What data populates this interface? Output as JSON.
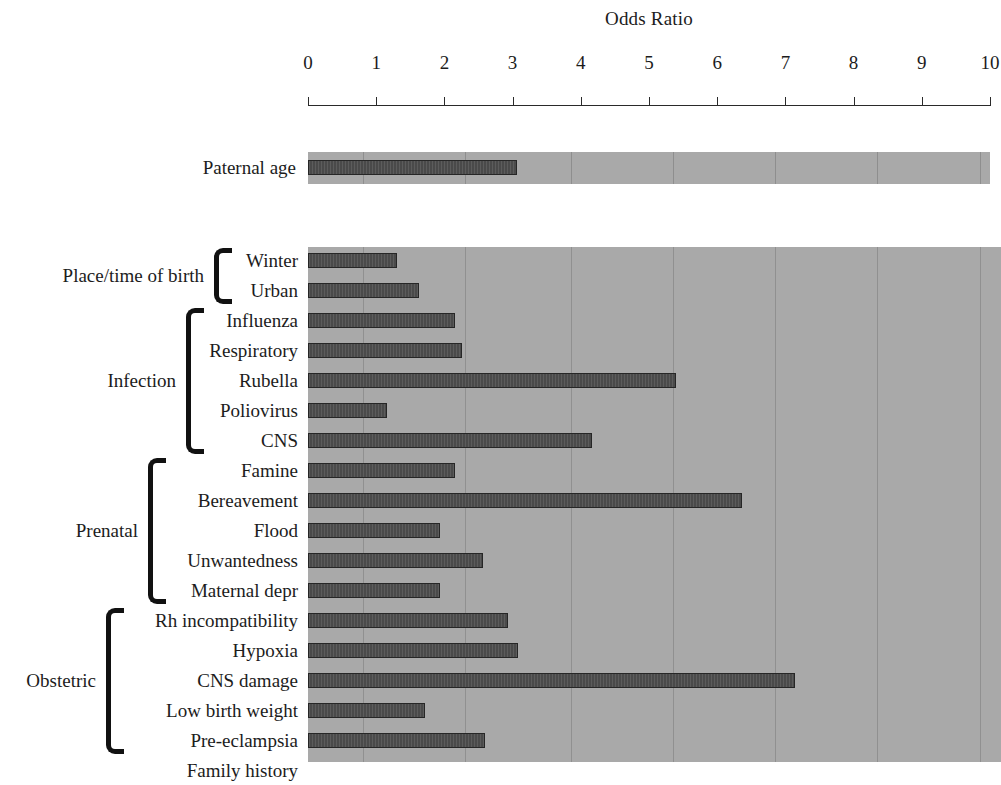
{
  "chart_data": {
    "type": "bar",
    "orientation": "horizontal",
    "title": "Odds Ratio",
    "xlabel": "",
    "ylabel": "",
    "xlim": [
      0,
      10
    ],
    "xticks": [
      0,
      1,
      2,
      3,
      4,
      5,
      6,
      7,
      8,
      9,
      10
    ],
    "xtick_labels": [
      "0",
      "1",
      "2",
      "3",
      "4",
      "5",
      "6",
      "7",
      "8",
      "9",
      "10"
    ],
    "grid": true,
    "grid_axis": "x",
    "legend": "none",
    "panels": [
      {
        "name": "paternal-age-panel",
        "categories": [
          "Paternal age"
        ],
        "values": [
          3.06
        ]
      },
      {
        "name": "risk-factors-panel",
        "categories": [
          "Winter",
          "Urban",
          "Influenza",
          "Respiratory",
          "Rubella",
          "Poliovirus",
          "CNS",
          "Famine",
          "Bereavement",
          "Flood",
          "Unwantedness",
          "Maternal depr",
          "Rh incompatibility",
          "Hypoxia",
          "CNS damage",
          "Low birth weight",
          "Pre-eclampsia",
          "Family history"
        ],
        "values": [
          1.3,
          1.63,
          2.16,
          2.26,
          5.4,
          1.16,
          4.16,
          2.16,
          6.36,
          1.94,
          2.57,
          1.94,
          2.93,
          3.08,
          7.14,
          1.72,
          2.6,
          9.85
        ]
      }
    ],
    "groups": [
      {
        "label": "Place/time of birth",
        "members": [
          "Winter",
          "Urban"
        ]
      },
      {
        "label": "Infection",
        "members": [
          "Influenza",
          "Respiratory",
          "Rubella",
          "Poliovirus",
          "CNS"
        ]
      },
      {
        "label": "Prenatal",
        "members": [
          "Famine",
          "Bereavement",
          "Flood",
          "Unwantedness",
          "Maternal depr"
        ]
      },
      {
        "label": "Obstetric",
        "members": [
          "Rh incompatibility",
          "Hypoxia",
          "CNS damage",
          "Low birth weight",
          "Pre-eclampsia"
        ]
      }
    ],
    "colors": {
      "bar": "#4a4a4a",
      "bar_edge": "#262626",
      "panel_background": "#a9a9a9",
      "figure_background": "#ffffff",
      "text": "#1c1c1c",
      "gridline": "#787878",
      "axis": "#2a2a2a",
      "bracket": "#111111"
    }
  },
  "paternal": {
    "label": "Paternal age"
  }
}
